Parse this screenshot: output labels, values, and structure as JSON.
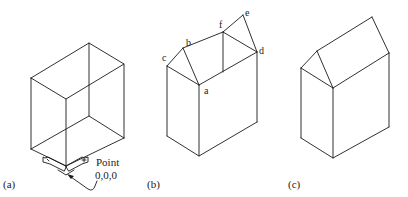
{
  "figures": [
    {
      "id": "a",
      "caption": "(a)",
      "annotation": {
        "line1": "Point",
        "line2": "0,0,0"
      }
    },
    {
      "id": "b",
      "caption": "(b)",
      "vertex_labels": {
        "a": "a",
        "b": "b",
        "c": "c",
        "d": "d",
        "e": "e",
        "f": "f"
      }
    },
    {
      "id": "c",
      "caption": "(c)"
    }
  ],
  "colors": {
    "line": "#1a1a1a",
    "background": "#ffffff"
  }
}
